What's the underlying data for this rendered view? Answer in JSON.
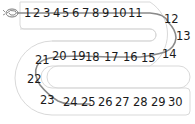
{
  "worksheet": {
    "title": "Number track 1 to 30",
    "start_icon": "snail-scribble-icon",
    "colors": {
      "track_outline": "#d9d9d9",
      "path_line": "#8a8a8a",
      "numbers": "#1a1a1a",
      "background": "#ffffff"
    },
    "numbers": [
      {
        "label": "1",
        "x": 24,
        "y": 17
      },
      {
        "label": "2",
        "x": 33,
        "y": 17
      },
      {
        "label": "3",
        "x": 43,
        "y": 17
      },
      {
        "label": "4",
        "x": 53,
        "y": 17
      },
      {
        "label": "5",
        "x": 62,
        "y": 17
      },
      {
        "label": "6",
        "x": 72,
        "y": 17
      },
      {
        "label": "7",
        "x": 82,
        "y": 17
      },
      {
        "label": "8",
        "x": 92,
        "y": 17
      },
      {
        "label": "9",
        "x": 102,
        "y": 17
      },
      {
        "label": "10",
        "x": 112,
        "y": 17
      },
      {
        "label": "11",
        "x": 128,
        "y": 17
      },
      {
        "label": "12",
        "x": 164,
        "y": 23
      },
      {
        "label": "13",
        "x": 176,
        "y": 40
      },
      {
        "label": "14",
        "x": 162,
        "y": 58
      },
      {
        "label": "15",
        "x": 141,
        "y": 62
      },
      {
        "label": "16",
        "x": 123,
        "y": 61
      },
      {
        "label": "17",
        "x": 104,
        "y": 61
      },
      {
        "label": "18",
        "x": 85,
        "y": 61
      },
      {
        "label": "19",
        "x": 71,
        "y": 60
      },
      {
        "label": "20",
        "x": 52,
        "y": 60
      },
      {
        "label": "21",
        "x": 35,
        "y": 64
      },
      {
        "label": "22",
        "x": 27,
        "y": 83
      },
      {
        "label": "23",
        "x": 40,
        "y": 104
      },
      {
        "label": "24",
        "x": 63,
        "y": 106
      },
      {
        "label": "25",
        "x": 81,
        "y": 106
      },
      {
        "label": "26",
        "x": 98,
        "y": 106
      },
      {
        "label": "27",
        "x": 115,
        "y": 106
      },
      {
        "label": "28",
        "x": 133,
        "y": 106
      },
      {
        "label": "29",
        "x": 151,
        "y": 106
      },
      {
        "label": "30",
        "x": 168,
        "y": 106
      }
    ]
  }
}
